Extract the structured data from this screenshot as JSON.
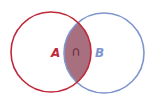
{
  "diagram": {
    "type": "venn",
    "sets": [
      {
        "name": "A",
        "label": "A",
        "color": "#c0283a",
        "cx": 51,
        "cy": 52,
        "r": 40
      },
      {
        "name": "B",
        "label": "B",
        "color": "#7f95cf",
        "cx": 104,
        "cy": 53,
        "r": 40
      }
    ],
    "intersection": {
      "symbol": "∩",
      "fill": "#a8707f",
      "label_color": "#6a2d3f"
    }
  }
}
